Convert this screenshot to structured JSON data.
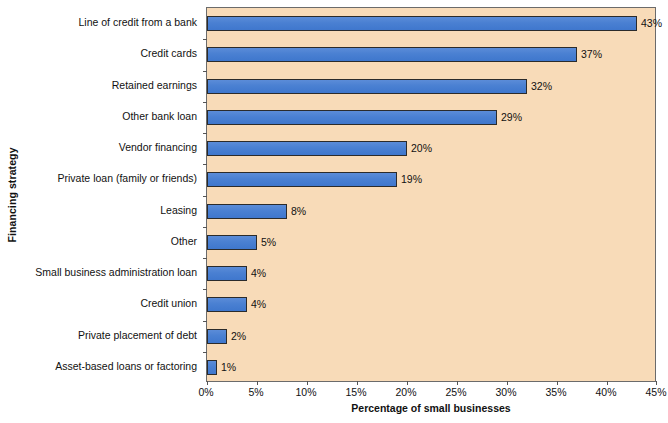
{
  "chart_data": {
    "type": "bar",
    "orientation": "horizontal",
    "title": "",
    "xlabel": "Percentage of small businesses",
    "ylabel": "Financing strategy",
    "xlim": [
      0,
      45
    ],
    "xtick_step": 5,
    "grid": false,
    "legend": null,
    "xtick_labels": [
      "0%",
      "5%",
      "10%",
      "15%",
      "20%",
      "25%",
      "30%",
      "35%",
      "40%",
      "45%"
    ],
    "xtick_values": [
      0,
      5,
      10,
      15,
      20,
      25,
      30,
      35,
      40,
      45
    ],
    "categories": [
      "Line of credit from a bank",
      "Credit cards",
      "Retained earnings",
      "Other bank loan",
      "Vendor financing",
      "Private loan (family or friends)",
      "Leasing",
      "Other",
      "Small business administration loan",
      "Credit union",
      "Private placement of debt",
      "Asset-based loans or factoring"
    ],
    "values": [
      43,
      37,
      32,
      29,
      20,
      19,
      8,
      5,
      4,
      4,
      2,
      1
    ],
    "value_labels": [
      "43%",
      "37%",
      "32%",
      "29%",
      "20%",
      "19%",
      "8%",
      "5%",
      "4%",
      "4%",
      "2%",
      "1%"
    ],
    "colors": {
      "bar_fill": "#4a80d2",
      "bar_edge": "#2b2b2b",
      "plot_background": "#f8dbb8",
      "plot_border": "#6b6b6b",
      "text": "#111111",
      "page_background": "#ffffff"
    }
  }
}
